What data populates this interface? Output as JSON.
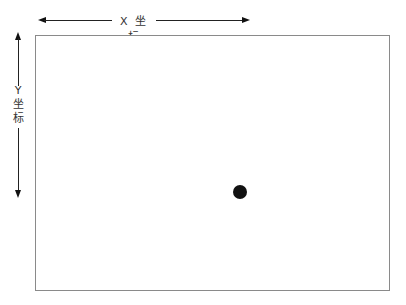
{
  "diagram": {
    "x_axis": {
      "label": "X 坐 标"
    },
    "y_axis": {
      "label_lines": [
        "Y",
        "坐",
        "标"
      ]
    },
    "canvas": {
      "border_color": "#8a8a8a"
    },
    "point": {
      "color": "#111111",
      "x_px": 240,
      "y_px": 192
    }
  }
}
